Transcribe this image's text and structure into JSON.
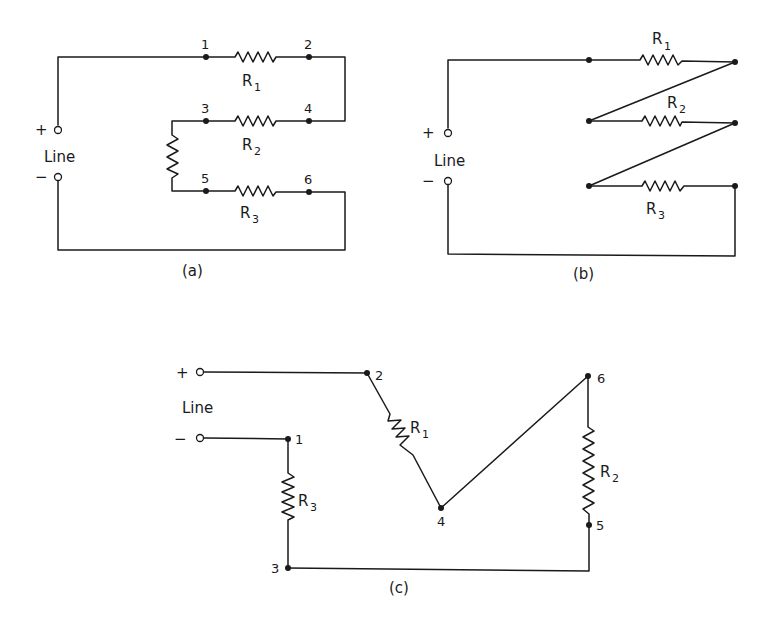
{
  "figure": {
    "panels": [
      {
        "id": "a",
        "caption": "(a)",
        "line_label": "Line",
        "plus": "+",
        "minus": "−",
        "nodes": [
          "1",
          "2",
          "3",
          "4",
          "5",
          "6"
        ],
        "resistors": [
          {
            "name": "R",
            "sub": "1"
          },
          {
            "name": "R",
            "sub": "2"
          },
          {
            "name": "R",
            "sub": "3"
          }
        ]
      },
      {
        "id": "b",
        "caption": "(b)",
        "line_label": "Line",
        "plus": "+",
        "minus": "−",
        "resistors": [
          {
            "name": "R",
            "sub": "1"
          },
          {
            "name": "R",
            "sub": "2"
          },
          {
            "name": "R",
            "sub": "3"
          }
        ]
      },
      {
        "id": "c",
        "caption": "(c)",
        "line_label": "Line",
        "plus": "+",
        "minus": "−",
        "nodes": [
          "1",
          "2",
          "3",
          "4",
          "5",
          "6"
        ],
        "resistors": [
          {
            "name": "R",
            "sub": "1"
          },
          {
            "name": "R",
            "sub": "2"
          },
          {
            "name": "R",
            "sub": "3"
          }
        ]
      }
    ],
    "colors": {
      "ink": "#1a1a1a",
      "background": "#ffffff"
    }
  }
}
